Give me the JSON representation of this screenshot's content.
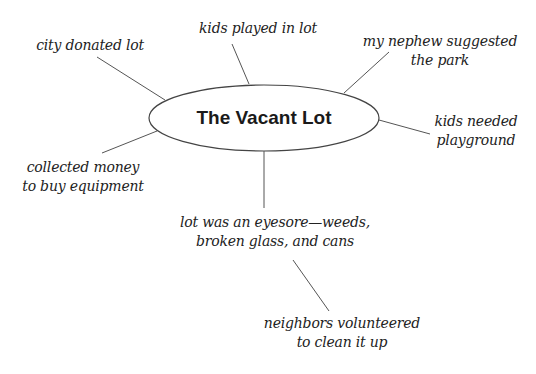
{
  "diagram": {
    "type": "cluster-map",
    "center": {
      "label": "The Vacant Lot"
    },
    "nodes": [
      {
        "id": "city-donated",
        "lines": [
          "city donated lot"
        ]
      },
      {
        "id": "kids-played",
        "lines": [
          "kids played in lot"
        ]
      },
      {
        "id": "nephew-suggested",
        "lines": [
          "my nephew suggested",
          "the park"
        ]
      },
      {
        "id": "kids-needed",
        "lines": [
          "kids needed",
          "playground"
        ]
      },
      {
        "id": "collected-money",
        "lines": [
          "collected money",
          "to buy equipment"
        ]
      },
      {
        "id": "eyesore",
        "lines": [
          "lot was an eyesore—weeds,",
          "broken glass, and cans"
        ]
      },
      {
        "id": "neighbors-volunteered",
        "lines": [
          "neighbors volunteered",
          "to clean it up"
        ]
      }
    ],
    "edges": [
      {
        "from": "center",
        "to": "city-donated"
      },
      {
        "from": "center",
        "to": "kids-played"
      },
      {
        "from": "center",
        "to": "nephew-suggested"
      },
      {
        "from": "center",
        "to": "kids-needed"
      },
      {
        "from": "center",
        "to": "collected-money"
      },
      {
        "from": "center",
        "to": "eyesore"
      },
      {
        "from": "eyesore",
        "to": "neighbors-volunteered"
      }
    ],
    "colors": {
      "line": "#555555",
      "text": "#222222",
      "background": "#ffffff"
    }
  }
}
